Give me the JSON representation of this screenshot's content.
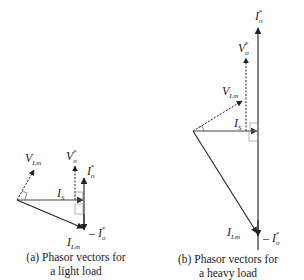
{
  "diagram": {
    "type": "phasor-diagram",
    "panels": [
      {
        "id": "a",
        "caption_line1": "(a) Phasor vectors for",
        "caption_line2": "a light load",
        "labels": {
          "v_lm": "V",
          "v_lm_sub": "Lm",
          "v_o": "V",
          "v_o_sub": "o",
          "v_o_sup": "*",
          "i_o": "I",
          "i_o_sub": "o",
          "i_o_sup": "*",
          "i_s": "I",
          "i_s_sub": "S",
          "i_lm": "I",
          "i_lm_sub": "Lm",
          "neg_i_o": "– I",
          "neg_i_o_sub": "o",
          "neg_i_o_sup": "*"
        }
      },
      {
        "id": "b",
        "caption_line1": "(b) Phasor vectors for",
        "caption_line2": "a heavy load",
        "labels": {
          "v_lm": "V",
          "v_lm_sub": "Lm",
          "v_o": "V",
          "v_o_sub": "o",
          "v_o_sup": "*",
          "i_o": "I",
          "i_o_sub": "o",
          "i_o_sup": "*",
          "i_s": "I",
          "i_s_sub": "S",
          "i_lm": "I",
          "i_lm_sub": "Lm",
          "neg_i_o": "– I",
          "neg_i_o_sub": "o",
          "neg_i_o_sup": "*"
        }
      }
    ],
    "colors": {
      "line": "#222222",
      "background": "#ffffff"
    }
  }
}
